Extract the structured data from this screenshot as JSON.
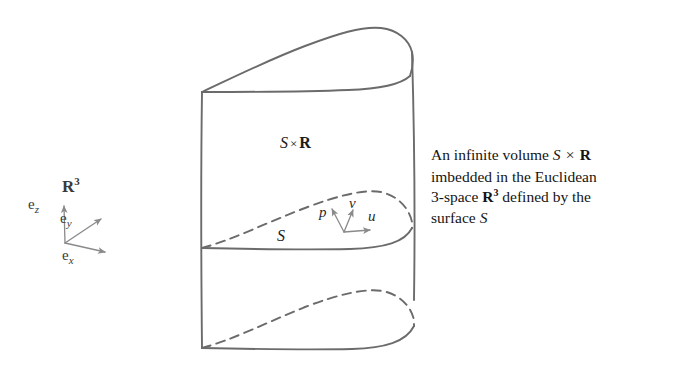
{
  "figure": {
    "stroke_color": "#6b6b6b",
    "axes": {
      "space_label": "R",
      "space_exponent": "3",
      "basis": [
        {
          "name": "e",
          "sub": "z",
          "direction": "up"
        },
        {
          "name": "e",
          "sub": "y",
          "direction": "up-right"
        },
        {
          "name": "e",
          "sub": "x",
          "direction": "right-down"
        }
      ]
    },
    "labels": {
      "volume_S": "S",
      "volume_times": "×",
      "volume_R": "R",
      "surface": "S",
      "point": "p",
      "tangent_v": "v",
      "tangent_u": "u"
    }
  },
  "caption": {
    "line1_a": "An infinite volume ",
    "line1_S": "S",
    "line1_times": "×",
    "line1_R": "R",
    "line2": "imbedded in the Euclidean",
    "line3_a": "3-space ",
    "line3_R": "R",
    "line3_exp": "3",
    "line3_b": " defined by the",
    "line4_a": "surface ",
    "line4_S": "S"
  }
}
